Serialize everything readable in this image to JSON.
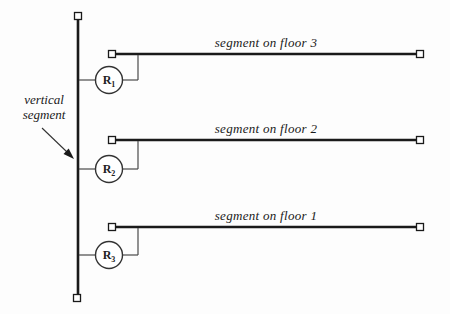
{
  "diagram": {
    "vertical_segment": {
      "label_line1": "vertical",
      "label_line2": "segment"
    },
    "floors": [
      {
        "label": "segment on floor 3"
      },
      {
        "label": "segment on floor 2"
      },
      {
        "label": "segment on floor 1"
      }
    ],
    "repeaters": [
      {
        "name": "R",
        "sub": "1"
      },
      {
        "name": "R",
        "sub": "2"
      },
      {
        "name": "R",
        "sub": "3"
      }
    ],
    "colors": {
      "segment_line": "#1a1a1a",
      "connector_line": "#4a4a4a",
      "circle_stroke": "#333333",
      "background": "#fdfdfd"
    }
  }
}
